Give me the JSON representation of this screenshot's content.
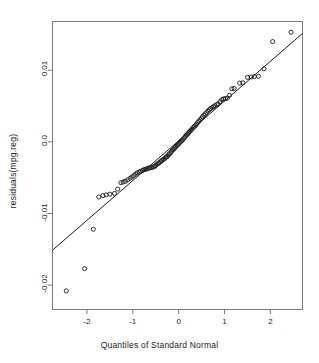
{
  "chart_data": {
    "type": "scatter",
    "title": "",
    "xlabel": "Quantiles of Standard Normal",
    "ylabel": "residuals(mpg.reg)",
    "xlim": [
      -2.75,
      2.7
    ],
    "ylim": [
      -0.0234,
      0.0168
    ],
    "grid": false,
    "legend": null,
    "xticks": [
      -2,
      -1,
      0,
      1,
      2
    ],
    "xtick_labels": [
      "-2",
      "-1",
      "0",
      "1",
      "2"
    ],
    "yticks": [
      0.01,
      0.0,
      -0.01,
      -0.02
    ],
    "ytick_labels": [
      "0.01",
      "0.0",
      "-0.01",
      "-0.02"
    ],
    "marker": "open-circle",
    "marker_size_px": 3.1,
    "marker_color": "#1a1a1a",
    "line_color": "#1a1a1a",
    "frame_color": "#7a7a7a",
    "reference_line": {
      "type": "qq-line",
      "x": [
        -2.75,
        2.7
      ],
      "y": [
        -0.01512,
        0.01513
      ]
    },
    "series": [
      {
        "name": "residuals(mpg.reg)",
        "points": [
          [
            -2.45,
            -0.0208
          ],
          [
            -2.05,
            -0.0177
          ],
          [
            -1.86,
            -0.0122
          ],
          [
            -1.74,
            -0.0077
          ],
          [
            -1.65,
            -0.0075
          ],
          [
            -1.58,
            -0.0074
          ],
          [
            -1.5,
            -0.0073
          ],
          [
            -1.4,
            -0.0072
          ],
          [
            -1.33,
            -0.0066
          ],
          [
            -1.26,
            -0.0057
          ],
          [
            -1.21,
            -0.0056
          ],
          [
            -1.16,
            -0.0055
          ],
          [
            -1.11,
            -0.0053
          ],
          [
            -1.06,
            -0.0051
          ],
          [
            -1.02,
            -0.0049
          ],
          [
            -0.98,
            -0.0047
          ],
          [
            -0.94,
            -0.0045
          ],
          [
            -0.9,
            -0.0043
          ],
          [
            -0.86,
            -0.0042
          ],
          [
            -0.83,
            -0.0041
          ],
          [
            -0.79,
            -0.004
          ],
          [
            -0.76,
            -0.0039
          ],
          [
            -0.73,
            -0.00385
          ],
          [
            -0.7,
            -0.0038
          ],
          [
            -0.67,
            -0.0037
          ],
          [
            -0.64,
            -0.00365
          ],
          [
            -0.61,
            -0.0036
          ],
          [
            -0.58,
            -0.00355
          ],
          [
            -0.55,
            -0.0035
          ],
          [
            -0.52,
            -0.0034
          ],
          [
            -0.5,
            -0.0033
          ],
          [
            -0.47,
            -0.0031
          ],
          [
            -0.44,
            -0.003
          ],
          [
            -0.42,
            -0.0029
          ],
          [
            -0.39,
            -0.00275
          ],
          [
            -0.37,
            -0.0026
          ],
          [
            -0.34,
            -0.0025
          ],
          [
            -0.32,
            -0.0024
          ],
          [
            -0.29,
            -0.00225
          ],
          [
            -0.27,
            -0.0021
          ],
          [
            -0.24,
            -0.002
          ],
          [
            -0.22,
            -0.0018
          ],
          [
            -0.2,
            -0.00165
          ],
          [
            -0.17,
            -0.0015
          ],
          [
            -0.15,
            -0.0013
          ],
          [
            -0.13,
            -0.0011
          ],
          [
            -0.1,
            -0.001
          ],
          [
            -0.08,
            -0.0008
          ],
          [
            -0.06,
            -0.00065
          ],
          [
            -0.03,
            -0.0005
          ],
          [
            -0.01,
            -0.00035
          ],
          [
            0.01,
            -0.0002
          ],
          [
            0.03,
            -5e-05
          ],
          [
            0.06,
            0.0001
          ],
          [
            0.08,
            0.00025
          ],
          [
            0.1,
            0.0004
          ],
          [
            0.13,
            0.0006
          ],
          [
            0.15,
            0.0008
          ],
          [
            0.17,
            0.00095
          ],
          [
            0.2,
            0.0011
          ],
          [
            0.22,
            0.0013
          ],
          [
            0.24,
            0.00145
          ],
          [
            0.27,
            0.0016
          ],
          [
            0.29,
            0.0018
          ],
          [
            0.32,
            0.002
          ],
          [
            0.34,
            0.00215
          ],
          [
            0.37,
            0.0023
          ],
          [
            0.39,
            0.0025
          ],
          [
            0.42,
            0.0027
          ],
          [
            0.44,
            0.0029
          ],
          [
            0.47,
            0.0031
          ],
          [
            0.5,
            0.0033
          ],
          [
            0.52,
            0.0035
          ],
          [
            0.55,
            0.0037
          ],
          [
            0.58,
            0.0039
          ],
          [
            0.61,
            0.0041
          ],
          [
            0.64,
            0.0043
          ],
          [
            0.67,
            0.0045
          ],
          [
            0.7,
            0.00465
          ],
          [
            0.73,
            0.0048
          ],
          [
            0.76,
            0.0049
          ],
          [
            0.79,
            0.00505
          ],
          [
            0.83,
            0.0052
          ],
          [
            0.86,
            0.0053
          ],
          [
            0.9,
            0.0056
          ],
          [
            0.94,
            0.0059
          ],
          [
            0.98,
            0.006
          ],
          [
            1.02,
            0.00605
          ],
          [
            1.06,
            0.0061
          ],
          [
            1.11,
            0.0065
          ],
          [
            1.16,
            0.0074
          ],
          [
            1.21,
            0.00745
          ],
          [
            1.33,
            0.0082
          ],
          [
            1.4,
            0.00825
          ],
          [
            1.5,
            0.009
          ],
          [
            1.58,
            0.00905
          ],
          [
            1.65,
            0.0091
          ],
          [
            1.74,
            0.00915
          ],
          [
            1.86,
            0.0102
          ],
          [
            2.05,
            0.014
          ],
          [
            2.45,
            0.0153
          ]
        ]
      }
    ]
  },
  "axes": {
    "x_title": "Quantiles of Standard Normal",
    "y_title": "residuals(mpg.reg)"
  }
}
